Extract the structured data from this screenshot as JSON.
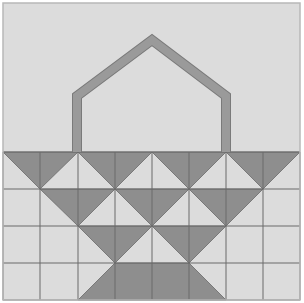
{
  "figure": {
    "title": "Basket quilt block"
  },
  "colors": {
    "background": "#dcdcdc",
    "frame": "#b8b8b8",
    "dark_fill": "#8e8e8e",
    "grid_line": "#6a6a6a",
    "handle_fill": "#9a9a9a",
    "handle_edge": "#7a7a7a"
  },
  "grid": {
    "columns": 8,
    "rows": 4,
    "x_edges": [
      3,
      40,
      78,
      115,
      152,
      189,
      226,
      263,
      300
    ],
    "y_edges": [
      152,
      189,
      226,
      263,
      300
    ]
  },
  "handle": {
    "points": [
      [
        77,
        152
      ],
      [
        77,
        96
      ],
      [
        152,
        40
      ],
      [
        226,
        96
      ],
      [
        226,
        152
      ]
    ],
    "stroke_width": 9
  },
  "dark_shapes": [
    [
      [
        3,
        152
      ],
      [
        78,
        152
      ],
      [
        40,
        189
      ]
    ],
    [
      [
        78,
        152
      ],
      [
        152,
        152
      ],
      [
        115,
        189
      ]
    ],
    [
      [
        152,
        152
      ],
      [
        226,
        152
      ],
      [
        189,
        189
      ]
    ],
    [
      [
        226,
        152
      ],
      [
        300,
        152
      ],
      [
        263,
        189
      ]
    ],
    [
      [
        40,
        189
      ],
      [
        115,
        189
      ],
      [
        78,
        226
      ]
    ],
    [
      [
        115,
        189
      ],
      [
        189,
        189
      ],
      [
        152,
        226
      ]
    ],
    [
      [
        189,
        189
      ],
      [
        263,
        189
      ],
      [
        226,
        226
      ]
    ],
    [
      [
        78,
        226
      ],
      [
        152,
        226
      ],
      [
        115,
        263
      ]
    ],
    [
      [
        152,
        226
      ],
      [
        226,
        226
      ],
      [
        189,
        263
      ]
    ],
    [
      [
        115,
        263
      ],
      [
        189,
        263
      ],
      [
        226,
        300
      ],
      [
        78,
        300
      ]
    ]
  ]
}
